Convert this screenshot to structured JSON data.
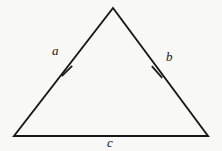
{
  "figure": {
    "kind": "geometry-diagram",
    "shape": "triangle",
    "width": 222,
    "height": 151,
    "background_color": "#f8f8f7",
    "stroke_color": "#171717"
  },
  "labels": {
    "left_side": "a",
    "right_side": "b",
    "base": "c"
  },
  "geometry": {
    "vertices": {
      "apex": {
        "x": 113,
        "y": 8
      },
      "bottom_left": {
        "x": 14,
        "y": 136
      },
      "bottom_right": {
        "x": 208,
        "y": 136
      }
    },
    "edges": [
      {
        "name": "left-side",
        "label": "a",
        "from": "apex",
        "to": "bottom_left",
        "tick_marks": 1
      },
      {
        "name": "right-side",
        "label": "b",
        "from": "apex",
        "to": "bottom_right",
        "tick_marks": 1
      },
      {
        "name": "base",
        "label": "c",
        "from": "bottom_left",
        "to": "bottom_right",
        "tick_marks": 0
      }
    ],
    "tick_marks": [
      {
        "name": "left-tick",
        "center": {
          "x": 67,
          "y": 71
        },
        "length": 13
      },
      {
        "name": "right-tick",
        "center": {
          "x": 157,
          "y": 72
        },
        "length": 13
      }
    ],
    "stroke_width": 1.9
  }
}
